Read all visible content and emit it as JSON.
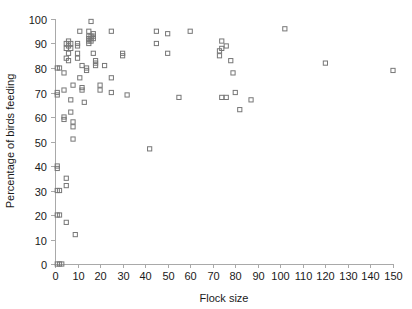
{
  "chart_data": {
    "type": "scatter",
    "title": "",
    "xlabel": "Flock size",
    "ylabel": "Percentage of birds feeding",
    "xlim": [
      0,
      150
    ],
    "ylim": [
      0,
      100
    ],
    "xticks": [
      0,
      10,
      20,
      30,
      40,
      50,
      60,
      70,
      80,
      90,
      100,
      110,
      120,
      130,
      140,
      150
    ],
    "yticks": [
      0,
      10,
      20,
      30,
      40,
      50,
      60,
      70,
      80,
      90,
      100
    ],
    "grid": false,
    "legend": null,
    "marker": "open-square",
    "marker_color": "#777777",
    "series": [
      {
        "name": "birds",
        "points": [
          [
            1,
            0
          ],
          [
            2,
            0
          ],
          [
            3,
            0
          ],
          [
            1,
            20
          ],
          [
            1,
            30
          ],
          [
            1,
            40
          ],
          [
            1,
            39
          ],
          [
            1,
            70
          ],
          [
            1,
            69
          ],
          [
            1,
            80
          ],
          [
            2,
            80
          ],
          [
            2,
            30
          ],
          [
            2,
            20
          ],
          [
            4,
            78
          ],
          [
            4,
            71
          ],
          [
            4,
            60
          ],
          [
            4,
            59
          ],
          [
            5,
            35
          ],
          [
            5,
            32
          ],
          [
            5,
            17
          ],
          [
            5,
            90
          ],
          [
            5,
            88
          ],
          [
            5,
            84
          ],
          [
            6,
            91
          ],
          [
            6,
            89
          ],
          [
            6,
            86
          ],
          [
            6,
            83
          ],
          [
            7,
            90
          ],
          [
            7,
            88
          ],
          [
            7,
            67
          ],
          [
            7,
            62
          ],
          [
            8,
            73
          ],
          [
            8,
            58
          ],
          [
            8,
            56
          ],
          [
            8,
            51
          ],
          [
            9,
            12
          ],
          [
            10,
            90
          ],
          [
            10,
            89
          ],
          [
            10,
            86
          ],
          [
            10,
            84
          ],
          [
            11,
            95
          ],
          [
            11,
            76
          ],
          [
            12,
            81
          ],
          [
            12,
            72
          ],
          [
            12,
            71
          ],
          [
            13,
            66
          ],
          [
            14,
            80
          ],
          [
            14,
            79
          ],
          [
            15,
            95
          ],
          [
            15,
            93
          ],
          [
            15,
            92
          ],
          [
            15,
            91
          ],
          [
            15,
            90
          ],
          [
            16,
            99
          ],
          [
            16,
            93
          ],
          [
            16,
            92
          ],
          [
            16,
            91
          ],
          [
            17,
            94
          ],
          [
            17,
            93
          ],
          [
            17,
            92
          ],
          [
            17,
            86
          ],
          [
            18,
            83
          ],
          [
            18,
            82
          ],
          [
            18,
            81
          ],
          [
            20,
            73
          ],
          [
            20,
            71
          ],
          [
            22,
            81
          ],
          [
            25,
            95
          ],
          [
            25,
            76
          ],
          [
            25,
            70
          ],
          [
            30,
            86
          ],
          [
            30,
            85
          ],
          [
            32,
            69
          ],
          [
            42,
            47
          ],
          [
            45,
            95
          ],
          [
            45,
            90
          ],
          [
            50,
            94
          ],
          [
            50,
            86
          ],
          [
            55,
            68
          ],
          [
            60,
            95
          ],
          [
            73,
            87
          ],
          [
            73,
            85
          ],
          [
            74,
            91
          ],
          [
            74,
            88
          ],
          [
            76,
            89
          ],
          [
            78,
            83
          ],
          [
            79,
            78
          ],
          [
            74,
            68
          ],
          [
            76,
            68
          ],
          [
            80,
            70
          ],
          [
            82,
            63
          ],
          [
            87,
            67
          ],
          [
            102,
            96
          ],
          [
            120,
            82
          ],
          [
            150,
            79
          ]
        ]
      }
    ]
  },
  "axes": {
    "x_tick_labels": [
      "0",
      "10",
      "20",
      "30",
      "40",
      "50",
      "60",
      "70",
      "80",
      "90",
      "100",
      "110",
      "120",
      "130",
      "140",
      "150"
    ],
    "y_tick_labels": [
      "0",
      "10",
      "20",
      "30",
      "40",
      "50",
      "60",
      "70",
      "80",
      "90",
      "100"
    ],
    "x_axis_title": "Flock size",
    "y_axis_title": "Percentage of birds feeding"
  }
}
